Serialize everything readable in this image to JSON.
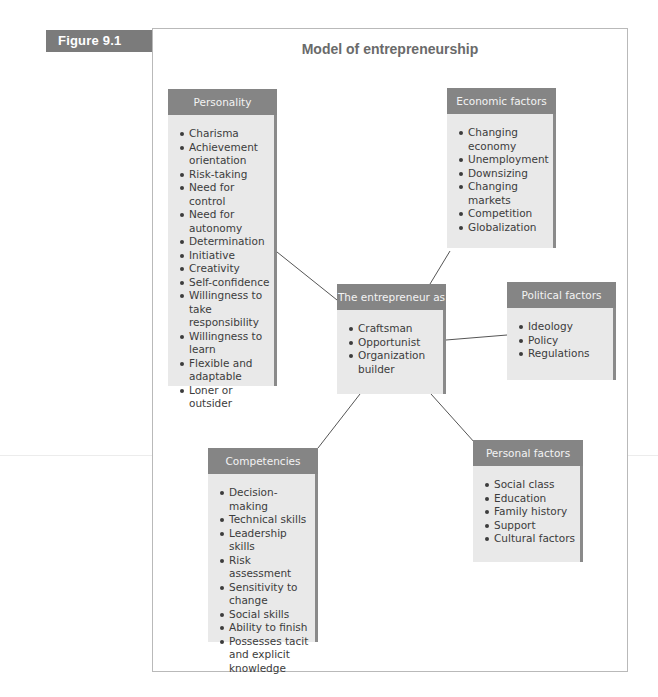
{
  "figure": {
    "label": "Figure 9.1",
    "title": "Model of entrepreneurship"
  },
  "boxes": {
    "personality": {
      "title": "Personality",
      "items": [
        "Charisma",
        "Achievement orientation",
        "Risk-taking",
        "Need for control",
        "Need for autonomy",
        "Determination",
        "Initiative",
        "Creativity",
        "Self-confidence",
        "Willingness to take responsibility",
        "Willingness to learn",
        "Flexible and adaptable",
        "Loner or outsider"
      ]
    },
    "economic": {
      "title": "Economic factors",
      "items": [
        "Changing economy",
        "Unemployment",
        "Downsizing",
        "Changing markets",
        "Competition",
        "Globalization"
      ]
    },
    "entrepreneur": {
      "title": "The entrepreneur as",
      "items": [
        "Craftsman",
        "Opportunist",
        "Organization builder"
      ]
    },
    "political": {
      "title": "Political factors",
      "items": [
        "Ideology",
        "Policy",
        "Regulations"
      ]
    },
    "competencies": {
      "title": "Competencies",
      "items": [
        "Decision-making",
        "Technical skills",
        "Leadership skills",
        "Risk assessment",
        "Sensitivity to change",
        "Social skills",
        "Ability to finish",
        "Possesses tacit and explicit knowledge"
      ]
    },
    "personal": {
      "title": "Personal factors",
      "items": [
        "Social class",
        "Education",
        "Family history",
        "Support",
        "Cultural factors"
      ]
    }
  },
  "colors": {
    "header": "#858585",
    "body": "#e9e9e9",
    "shadow": "#8a8a8a",
    "label": "#7b7b7b",
    "line": "#555555"
  }
}
